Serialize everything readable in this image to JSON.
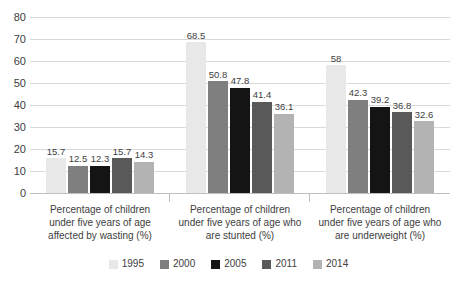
{
  "chart_data": {
    "type": "bar",
    "title": "",
    "subtitle": "",
    "xlabel": "",
    "ylabel": "",
    "ylim": [
      0,
      80
    ],
    "y_ticks": [
      0,
      10,
      20,
      30,
      40,
      50,
      60,
      70,
      80
    ],
    "grid": true,
    "legend_position": "bottom",
    "categories": [
      "Percentage of children under five years of age affected by wasting (%)",
      "Percentage of children under five years of age who are stunted (%)",
      "Percentage of children under five years of age who are underweight (%)"
    ],
    "series": [
      {
        "name": "1995",
        "color": "#e8e8e8",
        "values": [
          15.7,
          68.5,
          58
        ]
      },
      {
        "name": "2000",
        "color": "#7f7f7f",
        "values": [
          12.5,
          50.8,
          42.3
        ]
      },
      {
        "name": "2005",
        "color": "#141414",
        "values": [
          12.3,
          47.8,
          39.2
        ]
      },
      {
        "name": "2011",
        "color": "#595959",
        "values": [
          15.7,
          41.4,
          36.8
        ]
      },
      {
        "name": "2014",
        "color": "#b3b3b3",
        "values": [
          14.3,
          36.1,
          32.6
        ]
      }
    ],
    "value_labels": [
      [
        "15.7",
        "12.5",
        "12.3",
        "15.7",
        "14.3"
      ],
      [
        "68.5",
        "50.8",
        "47.8",
        "41.4",
        "36.1"
      ],
      [
        "58",
        "42.3",
        "39.2",
        "36.8",
        "32.6"
      ]
    ],
    "y_tick_labels": [
      "0",
      "10",
      "20",
      "30",
      "40",
      "50",
      "60",
      "70",
      "80"
    ],
    "colors": {
      "gridline": "#d9d9d9",
      "axis": "#bfbfbf",
      "text": "#404040",
      "background": "#ffffff"
    }
  }
}
